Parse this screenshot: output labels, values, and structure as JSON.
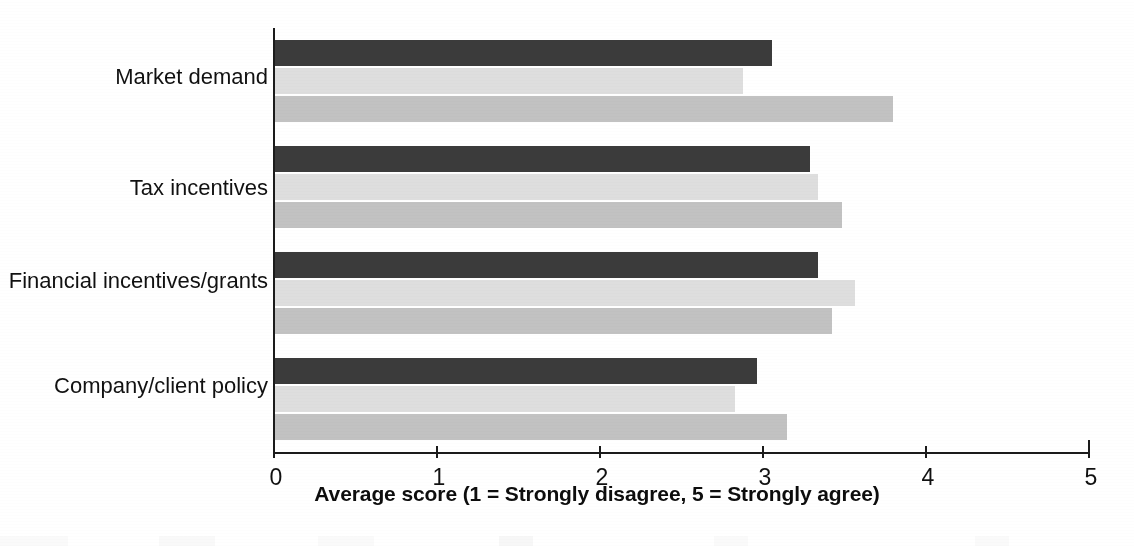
{
  "chart_data": {
    "type": "bar",
    "orientation": "horizontal",
    "title": "",
    "xlabel": "Average score (1 = Strongly disagree, 5 = Strongly agree)",
    "ylabel": "",
    "xlim": [
      0,
      5
    ],
    "xticks": [
      "0",
      "1",
      "2",
      "3",
      "4",
      "5"
    ],
    "grid": false,
    "legend": "none",
    "categories": [
      "Market demand",
      "Tax incentives",
      "Financial incentives/grants",
      "Company/client policy"
    ],
    "series": [
      {
        "name": "series-1",
        "color": "#3b3b3b",
        "values": [
          3.05,
          3.28,
          3.33,
          2.96
        ]
      },
      {
        "name": "series-2",
        "color": "#dedede",
        "values": [
          2.87,
          3.33,
          3.56,
          2.82
        ]
      },
      {
        "name": "series-3",
        "color": "#c2c2c2",
        "values": [
          3.79,
          3.48,
          3.42,
          3.14
        ]
      }
    ]
  },
  "axis": {
    "title": "Average score (1 = Strongly disagree, 5 = Strongly agree)",
    "tick_labels": [
      "0",
      "1",
      "2",
      "3",
      "4",
      "5"
    ]
  },
  "categories": {
    "0": "Market demand",
    "1": "Tax incentives",
    "2": "Financial incentives/grants",
    "3": "Company/client policy"
  }
}
